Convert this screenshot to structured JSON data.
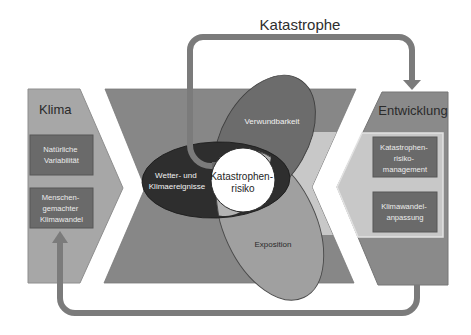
{
  "title": "Katastrophe",
  "left_panel": {
    "title": "Klima",
    "boxes": [
      {
        "lines": [
          "Natürliche",
          "Variabilität"
        ]
      },
      {
        "lines": [
          "Menschen-",
          "gemachter",
          "Klimawandel"
        ]
      }
    ]
  },
  "right_panel": {
    "title": "Entwicklung",
    "boxes": [
      {
        "lines": [
          "Katastrophen-",
          "risiko-",
          "management"
        ]
      },
      {
        "lines": [
          "Klimawandel-",
          "anpassung"
        ]
      }
    ]
  },
  "center": {
    "hazard": {
      "lines": [
        "Wetter- und",
        "Klimaereignisse"
      ]
    },
    "vulnerability": "Verwundbarkeit",
    "exposure": "Exposition",
    "risk": {
      "lines": [
        "Katastrophen-",
        "risiko"
      ]
    }
  },
  "colors": {
    "klima_panel": "#a7a7a7",
    "center_shape": "#878787",
    "light_band": "#c8c8c8",
    "entwicklung_panel": "#8a8a8a",
    "box": "#6a6a6a",
    "hazard_ellipse": "#2e2e2e",
    "vulnerability_ellipse": "#6c6c6c",
    "exposure_ellipse": "#a0a0a0",
    "overlap_lens": "#b4b4b4",
    "risk_circle": "#ffffff",
    "arrow": "#7b7b7b"
  }
}
